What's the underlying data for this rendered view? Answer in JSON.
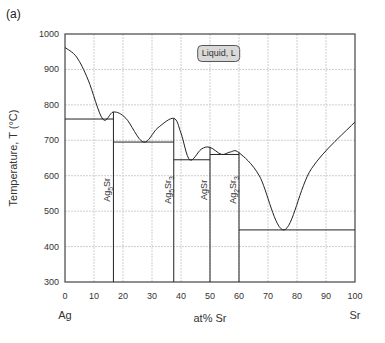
{
  "panel_label": "(a)",
  "chart_data": {
    "type": "line",
    "title": "",
    "subtitle": "Ag–Sr phase diagram",
    "xlabel": "at% Sr",
    "ylabel": "Temperature, T (°C)",
    "xlim": [
      0,
      100
    ],
    "ylim": [
      300,
      1000
    ],
    "x_ticks": [
      0,
      10,
      20,
      30,
      40,
      50,
      60,
      70,
      80,
      90,
      100
    ],
    "y_ticks": [
      300,
      400,
      500,
      600,
      700,
      800,
      900,
      1000
    ],
    "grid": true,
    "end_labels": {
      "left": "Ag",
      "right": "Sr"
    },
    "region_labels": [
      {
        "text": "Liquid, L",
        "x": 53,
        "y": 945
      }
    ],
    "liquidus": [
      {
        "x": 0,
        "y": 962
      },
      {
        "x": 4,
        "y": 935
      },
      {
        "x": 8,
        "y": 870
      },
      {
        "x": 13,
        "y": 760
      },
      {
        "x": 16.7,
        "y": 780
      },
      {
        "x": 21,
        "y": 762
      },
      {
        "x": 27,
        "y": 695
      },
      {
        "x": 32,
        "y": 735
      },
      {
        "x": 37.5,
        "y": 762
      },
      {
        "x": 40,
        "y": 720
      },
      {
        "x": 43,
        "y": 645
      },
      {
        "x": 47,
        "y": 675
      },
      {
        "x": 50,
        "y": 680
      },
      {
        "x": 54,
        "y": 660
      },
      {
        "x": 57,
        "y": 667
      },
      {
        "x": 60,
        "y": 665
      },
      {
        "x": 67,
        "y": 600
      },
      {
        "x": 75.5,
        "y": 447
      },
      {
        "x": 85,
        "y": 620
      },
      {
        "x": 100,
        "y": 752
      }
    ],
    "compounds": [
      {
        "name": "Ag5Sr",
        "label_main": "Ag",
        "sub1": "5",
        "mid": "Sr",
        "sub2": "",
        "x": 16.7,
        "tmax": 780
      },
      {
        "name": "Ag5Sr3",
        "label_main": "Ag",
        "sub1": "5",
        "mid": "Sr",
        "sub2": "3",
        "x": 37.5,
        "tmax": 762
      },
      {
        "name": "AgSr",
        "label_main": "AgSr",
        "sub1": "",
        "mid": "",
        "sub2": "",
        "x": 50,
        "tmax": 680
      },
      {
        "name": "Ag2Sr3",
        "label_main": "Ag",
        "sub1": "2",
        "mid": "Sr",
        "sub2": "3",
        "x": 60,
        "tmax": 665
      }
    ],
    "eutectics": [
      {
        "x_from": 0,
        "x_to": 16.7,
        "y": 760
      },
      {
        "x_from": 16.7,
        "x_to": 37.5,
        "y": 695
      },
      {
        "x_from": 37.5,
        "x_to": 50,
        "y": 645
      },
      {
        "x_from": 50,
        "x_to": 60,
        "y": 660
      },
      {
        "x_from": 60,
        "x_to": 100,
        "y": 447
      }
    ]
  }
}
